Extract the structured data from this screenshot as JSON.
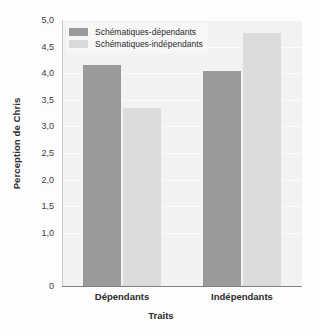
{
  "chart_data": {
    "type": "bar",
    "title": "",
    "xlabel": "Traits",
    "ylabel": "Perception de Chris",
    "categories": [
      "Dépendants",
      "Indépendants"
    ],
    "series": [
      {
        "name": "Schématiques-dépendants",
        "color": "#9a9a9a",
        "values": [
          4.15,
          4.05
        ]
      },
      {
        "name": "Schématiques-indépendants",
        "color": "#dcdcdc",
        "values": [
          3.35,
          4.75
        ]
      }
    ],
    "ylim": [
      0,
      5
    ],
    "ytick_labels": [
      "5,0",
      "4,5",
      "4,0",
      "3,5",
      "3,0",
      "2,5",
      "2,0",
      "1,5",
      "1,0",
      "0"
    ],
    "ytick_values": [
      5.0,
      4.5,
      4.0,
      3.5,
      3.0,
      2.5,
      2.0,
      1.5,
      1.0,
      0
    ],
    "grid": true,
    "legend_position": "top-left"
  }
}
